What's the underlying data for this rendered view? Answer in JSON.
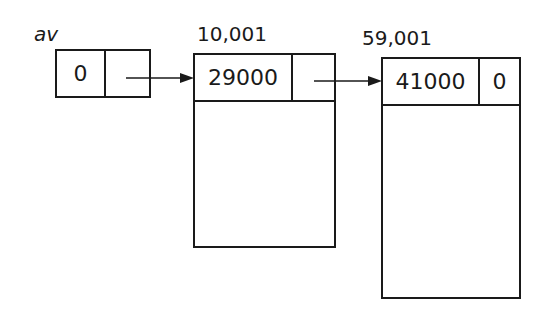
{
  "diagram": {
    "pointer": {
      "label": "av",
      "value": "0"
    },
    "blocks": [
      {
        "address": "10,001",
        "size": "29000",
        "next": ""
      },
      {
        "address": "59,001",
        "size": "41000",
        "next": "0"
      }
    ],
    "colors": {
      "line": "#1a1a1a",
      "background": "#ffffff"
    }
  }
}
